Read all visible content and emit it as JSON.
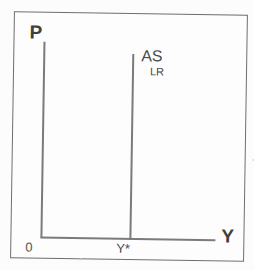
{
  "diagram": {
    "axes": {
      "y_label": "P",
      "x_label": "Y",
      "origin_label": "0"
    },
    "curves": [
      {
        "label": "AS",
        "subscript": "LR",
        "type": "vertical-line",
        "x_intercept_label": "Y*"
      }
    ],
    "colors": {
      "background": "#fcfcfc",
      "line": "#7b7b7b",
      "frame_border": "#6e6e6e",
      "text": "#3f3f3f"
    }
  }
}
